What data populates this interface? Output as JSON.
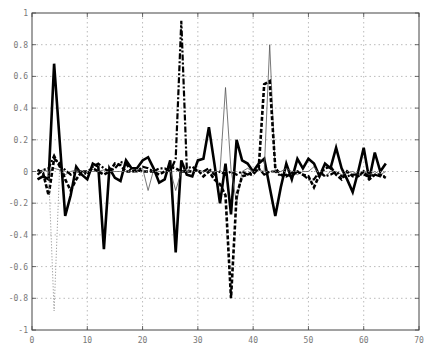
{
  "chart_data": {
    "type": "line",
    "title": "",
    "xlabel": "",
    "ylabel": "",
    "xlim": [
      0,
      70
    ],
    "ylim": [
      -1,
      1
    ],
    "xticks": [
      0,
      10,
      20,
      30,
      40,
      50,
      60,
      70
    ],
    "yticks": [
      -1,
      -0.8,
      -0.6,
      -0.4,
      -0.2,
      0,
      0.2,
      0.4,
      0.6,
      0.8,
      1
    ],
    "xtick_labels": [
      "0",
      "10",
      "20",
      "30",
      "40",
      "50",
      "60",
      "70"
    ],
    "ytick_labels": [
      "-1",
      "-0.8",
      "-0.6",
      "-0.4",
      "-0.2",
      "0",
      "0.2",
      "0.4",
      "0.6",
      "0.8",
      "1"
    ],
    "grid": true,
    "legend": null,
    "x": [
      1,
      2,
      3,
      4,
      5,
      6,
      7,
      8,
      9,
      10,
      11,
      12,
      13,
      14,
      15,
      16,
      17,
      18,
      19,
      20,
      21,
      22,
      23,
      24,
      25,
      26,
      27,
      28,
      29,
      30,
      31,
      32,
      33,
      34,
      35,
      36,
      37,
      38,
      39,
      40,
      41,
      42,
      43,
      44,
      45,
      46,
      47,
      48,
      49,
      50,
      51,
      52,
      53,
      54,
      55,
      56,
      57,
      58,
      59,
      60,
      61,
      62,
      63,
      64
    ],
    "series": [
      {
        "name": "thick-solid",
        "style": "solid",
        "width": 2.6,
        "color": "#000000",
        "values": [
          -0.05,
          -0.03,
          -0.05,
          0.68,
          0.2,
          -0.28,
          -0.15,
          0.03,
          -0.02,
          -0.05,
          0.05,
          0.03,
          -0.49,
          0.02,
          -0.04,
          -0.06,
          0.07,
          0.02,
          0.02,
          0.07,
          0.09,
          0.02,
          -0.07,
          -0.05,
          0.07,
          -0.51,
          0.07,
          -0.02,
          -0.03,
          0.07,
          0.08,
          0.28,
          0.05,
          -0.2,
          0.05,
          -0.27,
          0.2,
          0.07,
          0.05,
          0.0,
          0.05,
          0.08,
          -0.1,
          -0.28,
          -0.1,
          0.05,
          -0.05,
          0.08,
          0.02,
          0.08,
          0.05,
          -0.03,
          0.05,
          0.02,
          0.15,
          0.02,
          -0.05,
          -0.13,
          0.0,
          0.15,
          -0.05,
          0.12,
          0.0,
          0.05
        ]
      },
      {
        "name": "thin-solid",
        "style": "solid",
        "width": 0.8,
        "color": "#555555",
        "values": [
          0.0,
          0.01,
          0.0,
          0.02,
          0.01,
          -0.02,
          0.0,
          0.01,
          0.0,
          0.0,
          0.0,
          0.0,
          0.01,
          0.0,
          0.0,
          0.0,
          0.0,
          0.0,
          0.0,
          0.02,
          -0.12,
          0.01,
          0.0,
          0.0,
          0.01,
          -0.12,
          0.0,
          0.02,
          0.0,
          0.01,
          0.0,
          0.0,
          0.0,
          0.0,
          0.53,
          0.01,
          -0.2,
          0.0,
          0.02,
          0.0,
          0.01,
          0.0,
          0.8,
          0.0,
          0.0,
          0.02,
          0.0,
          -0.02,
          0.0,
          0.0,
          0.03,
          -0.02,
          -0.03,
          0.0,
          0.0,
          -0.02,
          -0.01,
          0.0,
          -0.02,
          0.0,
          -0.02,
          0.0,
          -0.02,
          0.0
        ]
      },
      {
        "name": "thick-dashed",
        "style": "dashed",
        "width": 2.6,
        "color": "#000000",
        "values": [
          0.01,
          -0.01,
          -0.15,
          0.08,
          0.05,
          -0.05,
          -0.12,
          -0.05,
          0.0,
          0.0,
          0.02,
          0.0,
          -0.02,
          0.0,
          0.05,
          0.04,
          0.0,
          0.0,
          0.01,
          0.0,
          0.0,
          0.0,
          -0.02,
          0.0,
          0.03,
          0.02,
          0.0,
          0.0,
          0.0,
          0.01,
          -0.03,
          0.0,
          -0.05,
          -0.08,
          -0.15,
          -0.8,
          -0.15,
          -0.03,
          -0.02,
          0.0,
          0.02,
          0.55,
          0.57,
          0.02,
          -0.02,
          -0.03,
          -0.01,
          0.0,
          -0.02,
          -0.03,
          -0.1,
          -0.02,
          0.02,
          0.03,
          -0.02,
          -0.05,
          0.0,
          -0.03,
          -0.03,
          0.0,
          -0.05,
          -0.02,
          -0.02,
          -0.04
        ]
      },
      {
        "name": "dash-dot",
        "style": "dashdot",
        "width": 2.2,
        "color": "#000000",
        "values": [
          -0.02,
          0.01,
          0.02,
          0.1,
          0.03,
          0.01,
          -0.02,
          0.0,
          0.0,
          -0.02,
          0.03,
          0.05,
          0.02,
          0.0,
          0.02,
          0.06,
          0.05,
          0.0,
          0.0,
          0.03,
          0.02,
          0.0,
          0.02,
          0.02,
          0.0,
          0.08,
          0.95,
          0.02,
          0.03,
          0.0,
          0.0,
          0.02,
          -0.02,
          0.0,
          -0.02,
          0.0,
          -0.02,
          0.0,
          -0.02,
          -0.02,
          0.02,
          -0.02,
          0.0,
          0.0,
          -0.03,
          -0.02,
          -0.03,
          0.0,
          -0.02,
          -0.05,
          -0.05,
          0.0,
          -0.03,
          -0.02,
          0.0,
          -0.03,
          -0.03,
          -0.02,
          -0.02,
          -0.02,
          -0.03,
          -0.02,
          -0.03,
          -0.03
        ]
      },
      {
        "name": "thin-dotted",
        "style": "dotted",
        "width": 1.0,
        "color": "#888888",
        "values": [
          0.0,
          0.0,
          0.0,
          -0.88,
          0.02,
          0.0,
          0.0,
          0.0,
          0.0,
          0.0,
          0.0,
          0.0,
          0.0,
          0.0,
          0.0,
          0.0,
          0.0,
          0.0,
          0.0,
          0.0,
          0.0,
          0.0,
          0.0,
          0.0,
          0.0,
          0.0,
          0.0,
          0.0,
          0.0,
          0.0,
          0.0,
          0.0,
          0.0,
          0.0,
          0.0,
          0.0,
          0.0,
          0.0,
          0.0,
          0.0,
          0.0,
          0.0,
          0.0,
          0.0,
          0.0,
          0.0,
          0.0,
          0.0,
          0.0,
          0.0,
          0.0,
          0.0,
          0.0,
          0.0,
          0.0,
          0.0,
          0.0,
          0.0,
          0.0,
          0.0,
          0.0,
          0.0,
          0.0,
          0.0
        ]
      }
    ],
    "plot_area": {
      "left": 32,
      "right": 419,
      "top": 13,
      "bottom": 330
    },
    "colors": {
      "axis": "#444444",
      "grid": "#bbbbbb",
      "tick_label": "#777777"
    }
  }
}
